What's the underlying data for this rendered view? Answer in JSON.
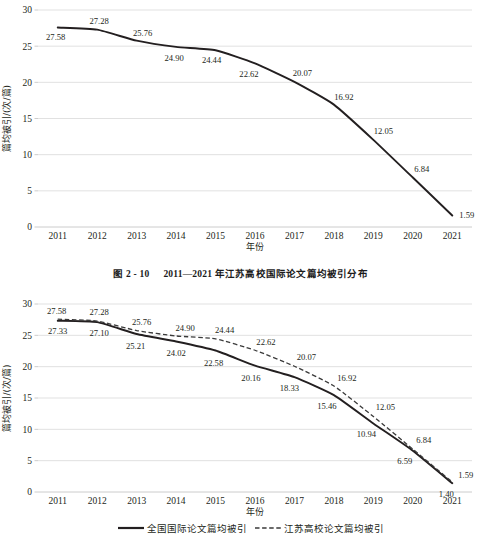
{
  "figure": {
    "caption_number": "图 2 - 10",
    "caption_title": "2011—2021 年江苏高校国际论文篇均被引分布"
  },
  "chart_data": [
    {
      "id": "top",
      "type": "line",
      "title": "",
      "xlabel": "年份",
      "ylabel": "篇均被引/(次/篇)",
      "x": [
        "2011",
        "2012",
        "2013",
        "2014",
        "2015",
        "2016",
        "2017",
        "2018",
        "2019",
        "2020",
        "2021"
      ],
      "categories": [
        "2011",
        "2012",
        "2013",
        "2014",
        "2015",
        "2016",
        "2017",
        "2018",
        "2019",
        "2020",
        "2021"
      ],
      "ylim": [
        0,
        30
      ],
      "yticks": [
        0,
        5,
        10,
        15,
        20,
        25,
        30
      ],
      "grid": true,
      "legend": "none",
      "series": [
        {
          "name": "江苏高校国际论文篇均被引",
          "style": "solid",
          "color": "#231f20",
          "values": [
            27.58,
            27.28,
            25.76,
            24.9,
            24.44,
            22.62,
            20.07,
            16.92,
            12.05,
            6.84,
            1.59
          ],
          "labels": [
            "27.58",
            "27.28",
            "25.76",
            "24.90",
            "24.44",
            "22.62",
            "20.07",
            "16.92",
            "12.05",
            "6.84",
            "1.59"
          ]
        }
      ]
    },
    {
      "id": "bottom",
      "type": "line",
      "title": "",
      "xlabel": "年份",
      "ylabel": "篇均被引/(次/篇)",
      "x": [
        "2011",
        "2012",
        "2013",
        "2014",
        "2015",
        "2016",
        "2017",
        "2018",
        "2019",
        "2020",
        "2021"
      ],
      "categories": [
        "2011",
        "2012",
        "2013",
        "2014",
        "2015",
        "2016",
        "2017",
        "2018",
        "2019",
        "2020",
        "2021"
      ],
      "ylim": [
        0,
        30
      ],
      "yticks": [
        0,
        5,
        10,
        15,
        20,
        25,
        30
      ],
      "grid": true,
      "legend": "bottom",
      "series": [
        {
          "name": "全国国际论文篇均被引",
          "style": "solid",
          "color": "#231f20",
          "values": [
            27.33,
            27.1,
            25.21,
            24.02,
            22.58,
            20.16,
            18.33,
            15.46,
            10.94,
            6.59,
            1.4
          ],
          "labels": [
            "27.33",
            "27.10",
            "25.21",
            "24.02",
            "22.58",
            "20.16",
            "18.33",
            "15.46",
            "10.94",
            "6.59",
            "1.40"
          ]
        },
        {
          "name": "江苏高校论文篇均被引",
          "style": "dashed",
          "color": "#3a3a3a",
          "values": [
            27.58,
            27.28,
            25.76,
            24.9,
            24.44,
            22.62,
            20.07,
            16.92,
            12.05,
            6.84,
            1.59
          ],
          "labels": [
            "27.58",
            "27.28",
            "25.76",
            "24.90",
            "24.44",
            "22.62",
            "20.07",
            "16.92",
            "12.05",
            "6.84",
            "1.59"
          ]
        }
      ]
    }
  ]
}
